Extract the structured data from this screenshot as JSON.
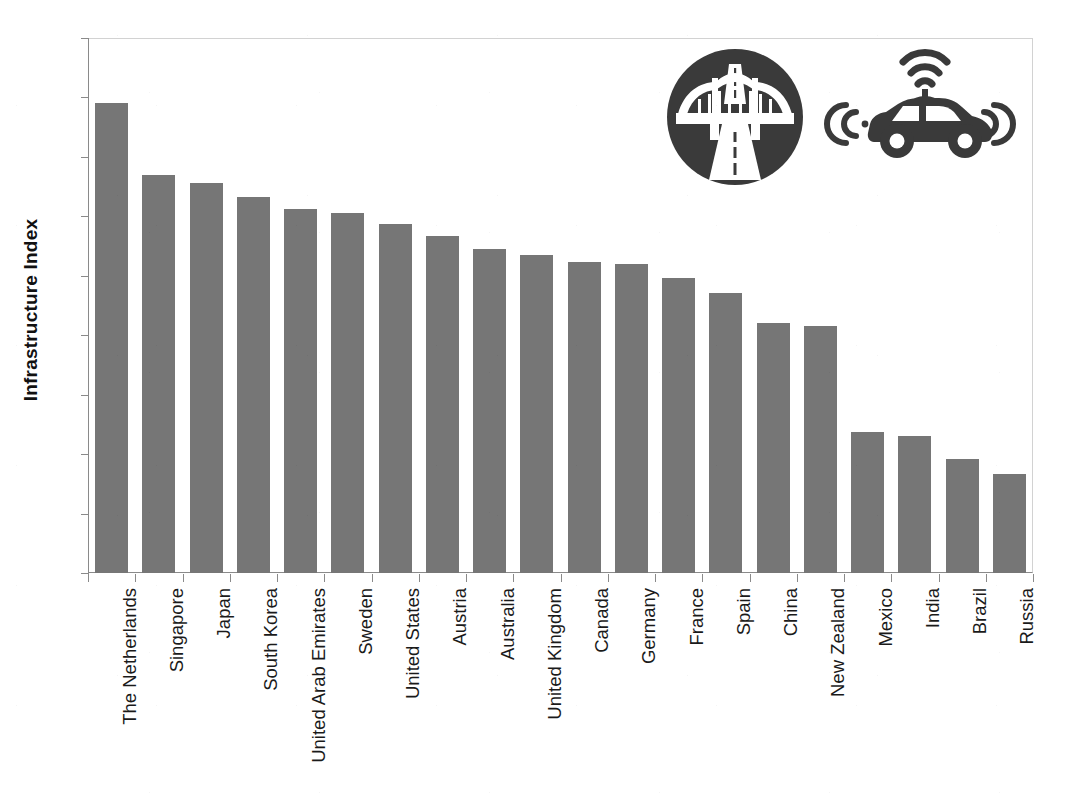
{
  "chart_data": {
    "type": "bar",
    "title": "",
    "xlabel": "",
    "ylabel": "Infrastructure Index",
    "ylim": [
      0,
      9
    ],
    "y_ticks": [
      0,
      1,
      2,
      3,
      4,
      5,
      6,
      7,
      8,
      9
    ],
    "grid": false,
    "legend": null,
    "orientation": "vertical",
    "bar_color": "#767676",
    "categories": [
      "The Netherlands",
      "Singapore",
      "Japan",
      "South Korea",
      "United Arab Emirates",
      "Sweden",
      "United States",
      "Austria",
      "Australia",
      "United Kingdom",
      "Canada",
      "Germany",
      "France",
      "Spain",
      "China",
      "New Zealand",
      "Mexico",
      "India",
      "Brazil",
      "Russia"
    ],
    "values": [
      7.91,
      6.7,
      6.56,
      6.33,
      6.12,
      6.05,
      5.87,
      5.67,
      5.45,
      5.35,
      5.24,
      5.19,
      4.96,
      4.71,
      4.2,
      4.15,
      2.37,
      2.31,
      1.92,
      1.66
    ]
  },
  "artwork": {
    "bridge_icon_name": "bridge-highway-icon",
    "car_icon_name": "connected-car-icon",
    "icon_color": "#3a3a3a"
  }
}
